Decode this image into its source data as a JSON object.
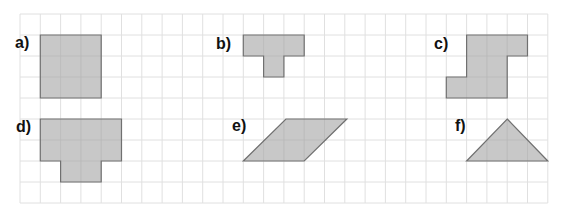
{
  "grid": {
    "origin_x": 20,
    "origin_y": 14,
    "cell_w": 20.3,
    "cell_h": 21,
    "cols": 26,
    "rows": 9,
    "line_color": "#e0e0e0"
  },
  "style": {
    "fill": "#c8c8c8",
    "stroke": "#707070",
    "label_color": "#111111"
  },
  "figures": [
    {
      "label": "a)",
      "label_pos": [
        15,
        48
      ],
      "shape": "polygon",
      "points": [
        [
          1,
          1
        ],
        [
          4,
          1
        ],
        [
          4,
          4
        ],
        [
          1,
          4
        ]
      ],
      "inner_lines": [
        [
          [
            2,
            1
          ],
          [
            2,
            4
          ]
        ],
        [
          [
            3,
            1
          ],
          [
            3,
            4
          ]
        ],
        [
          [
            1,
            2
          ],
          [
            4,
            2
          ]
        ],
        [
          [
            1,
            3
          ],
          [
            4,
            3
          ]
        ]
      ]
    },
    {
      "label": "b)",
      "label_pos": [
        216,
        49
      ],
      "shape": "polygon",
      "points": [
        [
          11,
          1
        ],
        [
          14,
          1
        ],
        [
          14,
          2
        ],
        [
          13,
          2
        ],
        [
          13,
          3
        ],
        [
          12,
          3
        ],
        [
          12,
          2
        ],
        [
          11,
          2
        ]
      ],
      "inner_lines": [
        [
          [
            12,
            1
          ],
          [
            12,
            2
          ]
        ],
        [
          [
            13,
            1
          ],
          [
            13,
            2
          ]
        ],
        [
          [
            12,
            2
          ],
          [
            13,
            2
          ]
        ]
      ]
    },
    {
      "label": "c)",
      "label_pos": [
        434,
        49
      ],
      "shape": "polygon",
      "points": [
        [
          22,
          1
        ],
        [
          25,
          1
        ],
        [
          25,
          2
        ],
        [
          24,
          2
        ],
        [
          24,
          4
        ],
        [
          21,
          4
        ],
        [
          21,
          3
        ],
        [
          22,
          3
        ]
      ],
      "inner_lines": [
        [
          [
            23,
            1
          ],
          [
            23,
            4
          ]
        ],
        [
          [
            24,
            1
          ],
          [
            24,
            2
          ]
        ],
        [
          [
            22,
            2
          ],
          [
            24,
            2
          ]
        ],
        [
          [
            22,
            3
          ],
          [
            24,
            3
          ]
        ],
        [
          [
            22,
            3
          ],
          [
            22,
            4
          ]
        ]
      ]
    },
    {
      "label": "d)",
      "label_pos": [
        16,
        132
      ],
      "shape": "polygon",
      "points": [
        [
          1,
          5
        ],
        [
          5,
          5
        ],
        [
          5,
          7
        ],
        [
          4,
          7
        ],
        [
          4,
          8
        ],
        [
          2,
          8
        ],
        [
          2,
          7
        ],
        [
          1,
          7
        ]
      ],
      "inner_lines": [
        [
          [
            2,
            5
          ],
          [
            2,
            7
          ]
        ],
        [
          [
            3,
            5
          ],
          [
            3,
            8
          ]
        ],
        [
          [
            4,
            5
          ],
          [
            4,
            7
          ]
        ],
        [
          [
            1,
            6
          ],
          [
            5,
            6
          ]
        ],
        [
          [
            2,
            7
          ],
          [
            4,
            7
          ]
        ]
      ]
    },
    {
      "label": "e)",
      "label_pos": [
        232,
        131
      ],
      "shape": "polygon",
      "points": [
        [
          13.1,
          5
        ],
        [
          16.1,
          5
        ],
        [
          14,
          7
        ],
        [
          11,
          7
        ]
      ],
      "inner_lines": [
        [
          [
            14,
            5
          ],
          [
            14,
            7
          ]
        ],
        [
          [
            15,
            5
          ],
          [
            15,
            6
          ]
        ],
        [
          [
            12.05,
            6
          ],
          [
            15.1,
            6
          ]
        ],
        [
          [
            13,
            5.1
          ],
          [
            13,
            7
          ]
        ],
        [
          [
            12,
            6
          ],
          [
            12,
            7
          ]
        ]
      ]
    },
    {
      "label": "f)",
      "label_pos": [
        455,
        131
      ],
      "shape": "polygon",
      "points": [
        [
          24,
          5
        ],
        [
          26,
          7
        ],
        [
          22,
          7
        ]
      ],
      "inner_lines": [
        [
          [
            23,
            6
          ],
          [
            25,
            6
          ]
        ],
        [
          [
            23,
            6
          ],
          [
            23,
            7
          ]
        ],
        [
          [
            24,
            5
          ],
          [
            24,
            7
          ]
        ],
        [
          [
            25,
            6
          ],
          [
            25,
            7
          ]
        ]
      ]
    }
  ]
}
